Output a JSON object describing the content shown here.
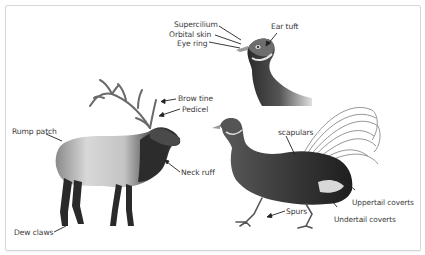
{
  "diagram": {
    "frame_color": "#d6d6d6",
    "label_color": "#3a3a3a",
    "subjects": [
      {
        "name": "elk",
        "view": "full body, side"
      },
      {
        "name": "pheasant",
        "view": "full body, side"
      },
      {
        "name": "pheasant-head",
        "view": "head and neck close-up"
      }
    ],
    "labels": {
      "supercilium": "Supercilium",
      "orbital_skin": "Orbital skin",
      "eye_ring": "Eye ring",
      "ear_tuft": "Ear tuft",
      "brow_tine": "Brow tine",
      "pedicel": "Pedicel",
      "rump_patch": "Rump patch",
      "neck_ruff": "Neck ruff",
      "dew_claws": "Dew claws",
      "scapulars": "scapulars",
      "uppertail_coverts": "Uppertail coverts",
      "undertail_coverts": "Undertail coverts",
      "spurs": "Spurs"
    }
  }
}
